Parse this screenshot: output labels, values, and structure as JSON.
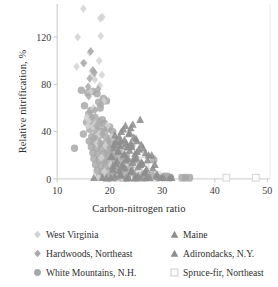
{
  "chart_data": {
    "type": "scatter",
    "title": "",
    "xlabel": "Carbon-nitrogen ratio",
    "ylabel": "Relative nitrification, %",
    "xlim": [
      7.5,
      50.5
    ],
    "ylim": [
      -6,
      148
    ],
    "xticks": [
      10,
      20,
      30,
      40,
      50
    ],
    "yticks": [
      0,
      40,
      80,
      120
    ],
    "grid": false,
    "legend_position": "below",
    "series": [
      {
        "name": "West Virginia",
        "marker": "diamond",
        "color": "#d2d2d2",
        "points": [
          [
            15.0,
            144
          ],
          [
            18.2,
            136
          ],
          [
            18.6,
            137
          ],
          [
            13.9,
            120
          ],
          [
            18.3,
            121
          ],
          [
            16.2,
            107
          ],
          [
            15.2,
            98
          ],
          [
            13.7,
            95
          ],
          [
            18.0,
            100
          ],
          [
            17.0,
            90
          ],
          [
            16.6,
            91
          ],
          [
            16.9,
            88
          ],
          [
            18.5,
            88
          ],
          [
            17.2,
            84
          ],
          [
            18.1,
            79
          ],
          [
            16.3,
            74
          ],
          [
            18.9,
            66
          ],
          [
            16.9,
            60
          ],
          [
            15.6,
            52
          ],
          [
            16.1,
            50
          ],
          [
            17.4,
            47
          ],
          [
            15.8,
            45
          ],
          [
            16.8,
            44
          ],
          [
            19.6,
            45
          ],
          [
            18.0,
            38
          ],
          [
            20.4,
            35
          ],
          [
            17.6,
            30
          ],
          [
            19.2,
            28
          ],
          [
            21.0,
            25
          ],
          [
            18.4,
            18
          ],
          [
            20.2,
            12
          ],
          [
            19.0,
            6
          ],
          [
            21.6,
            3
          ],
          [
            17.8,
            1
          ],
          [
            22.4,
            1
          ]
        ]
      },
      {
        "name": "Hardwoods, Northeast",
        "marker": "diamond",
        "color": "#a9a9a9",
        "points": [
          [
            16.4,
            108
          ],
          [
            15.0,
            98
          ],
          [
            16.8,
            92
          ],
          [
            17.1,
            90
          ],
          [
            16.2,
            85
          ],
          [
            15.9,
            78
          ],
          [
            17.8,
            76
          ],
          [
            16.0,
            70
          ],
          [
            18.4,
            63
          ],
          [
            17.2,
            58
          ],
          [
            16.6,
            52
          ],
          [
            18.0,
            49
          ],
          [
            17.5,
            45
          ],
          [
            19.0,
            42
          ],
          [
            18.6,
            38
          ],
          [
            17.0,
            35
          ],
          [
            19.8,
            33
          ],
          [
            18.2,
            30
          ],
          [
            20.0,
            27
          ],
          [
            19.4,
            22
          ],
          [
            20.8,
            18
          ],
          [
            19.2,
            14
          ],
          [
            21.2,
            10
          ],
          [
            20.6,
            6
          ],
          [
            22.0,
            3
          ],
          [
            21.0,
            1
          ],
          [
            23.0,
            0.5
          ]
        ]
      },
      {
        "name": "White Mountains, N.H.",
        "marker": "circle",
        "color": "#a6a6a6",
        "points": [
          [
            14.6,
            75
          ],
          [
            15.8,
            73
          ],
          [
            16.8,
            74
          ],
          [
            17.6,
            72
          ],
          [
            18.8,
            68
          ],
          [
            17.9,
            65
          ],
          [
            15.2,
            62
          ],
          [
            16.4,
            58
          ],
          [
            18.2,
            60
          ],
          [
            19.4,
            66
          ],
          [
            16.0,
            55
          ],
          [
            17.2,
            52
          ],
          [
            18.6,
            50
          ],
          [
            15.6,
            48
          ],
          [
            16.9,
            46
          ],
          [
            18.0,
            45
          ],
          [
            19.0,
            47
          ],
          [
            20.0,
            44
          ],
          [
            16.2,
            42
          ],
          [
            17.4,
            41
          ],
          [
            18.4,
            40
          ],
          [
            19.6,
            42
          ],
          [
            20.6,
            40
          ],
          [
            13.3,
            26
          ],
          [
            15.0,
            38
          ],
          [
            16.6,
            36
          ],
          [
            17.8,
            35
          ],
          [
            19.2,
            36
          ],
          [
            20.2,
            34
          ],
          [
            21.0,
            33
          ],
          [
            16.1,
            32
          ],
          [
            17.1,
            31
          ],
          [
            18.1,
            30
          ],
          [
            19.1,
            30
          ],
          [
            20.1,
            29
          ],
          [
            21.4,
            29
          ],
          [
            22.2,
            30
          ],
          [
            16.5,
            27
          ],
          [
            17.5,
            26
          ],
          [
            18.5,
            26
          ],
          [
            19.5,
            25
          ],
          [
            20.5,
            25
          ],
          [
            21.8,
            24
          ],
          [
            23.0,
            27
          ],
          [
            24.2,
            28
          ],
          [
            16.8,
            22
          ],
          [
            17.8,
            21
          ],
          [
            18.8,
            21
          ],
          [
            19.8,
            20
          ],
          [
            20.8,
            20
          ],
          [
            22.0,
            19
          ],
          [
            23.2,
            20
          ],
          [
            17.0,
            17
          ],
          [
            18.0,
            16
          ],
          [
            19.0,
            16
          ],
          [
            20.0,
            15
          ],
          [
            21.0,
            15
          ],
          [
            22.4,
            14
          ],
          [
            23.6,
            15
          ],
          [
            25.0,
            16
          ],
          [
            17.3,
            12
          ],
          [
            18.3,
            11
          ],
          [
            19.3,
            11
          ],
          [
            20.3,
            10
          ],
          [
            21.3,
            10
          ],
          [
            22.6,
            9
          ],
          [
            24.0,
            10
          ],
          [
            26.0,
            12
          ],
          [
            28.4,
            16
          ],
          [
            17.6,
            7
          ],
          [
            18.6,
            6
          ],
          [
            19.6,
            6
          ],
          [
            20.6,
            5
          ],
          [
            21.6,
            5
          ],
          [
            23.0,
            4
          ],
          [
            24.4,
            5
          ],
          [
            26.4,
            4
          ],
          [
            28.0,
            3
          ],
          [
            18.0,
            2
          ],
          [
            19.0,
            2
          ],
          [
            20.0,
            1
          ],
          [
            21.0,
            1
          ],
          [
            22.2,
            1
          ],
          [
            23.4,
            1
          ],
          [
            25.0,
            1
          ],
          [
            27.0,
            1
          ],
          [
            29.2,
            1
          ],
          [
            30.4,
            2
          ],
          [
            31.6,
            1
          ],
          [
            34.4,
            1
          ],
          [
            35.2,
            1
          ],
          [
            31.0,
            2
          ],
          [
            33.8,
            1
          ]
        ]
      },
      {
        "name": "Maine",
        "marker": "triangle",
        "color": "#8d8d8d",
        "points": [
          [
            25.8,
            50
          ],
          [
            23.0,
            45
          ],
          [
            24.0,
            43
          ],
          [
            22.2,
            40
          ],
          [
            23.6,
            38
          ],
          [
            21.8,
            36
          ],
          [
            24.6,
            35
          ],
          [
            22.8,
            33
          ],
          [
            25.2,
            32
          ],
          [
            21.2,
            31
          ],
          [
            23.2,
            30
          ],
          [
            26.0,
            29
          ],
          [
            22.0,
            28
          ],
          [
            24.2,
            27
          ],
          [
            20.8,
            26
          ],
          [
            25.6,
            25
          ],
          [
            23.8,
            24
          ],
          [
            21.6,
            23
          ],
          [
            26.8,
            22
          ],
          [
            24.8,
            21
          ],
          [
            22.6,
            20
          ],
          [
            28.0,
            20
          ],
          [
            20.4,
            19
          ],
          [
            25.0,
            18
          ],
          [
            23.4,
            17
          ],
          [
            27.2,
            16
          ],
          [
            21.4,
            15
          ],
          [
            24.4,
            14
          ],
          [
            26.2,
            13
          ],
          [
            22.4,
            12
          ],
          [
            28.6,
            12
          ],
          [
            20.6,
            11
          ],
          [
            25.4,
            10
          ],
          [
            23.0,
            9
          ],
          [
            27.0,
            8
          ],
          [
            21.8,
            7
          ],
          [
            24.0,
            6
          ],
          [
            26.6,
            5
          ],
          [
            29.0,
            4
          ],
          [
            22.2,
            3
          ],
          [
            25.0,
            2
          ],
          [
            27.6,
            1
          ],
          [
            20.2,
            1
          ],
          [
            23.2,
            0.5
          ],
          [
            29.8,
            1
          ],
          [
            31.4,
            1
          ],
          [
            26.0,
            0.5
          ],
          [
            18.6,
            1
          ],
          [
            17.0,
            1
          ]
        ]
      },
      {
        "name": "Adirondacks, N.Y.",
        "marker": "triangle",
        "color": "#8d8d8d",
        "points": [
          [
            24.4,
            46
          ],
          [
            22.6,
            42
          ],
          [
            23.8,
            39
          ],
          [
            21.0,
            37
          ],
          [
            25.0,
            34
          ],
          [
            22.0,
            32
          ],
          [
            24.0,
            30
          ],
          [
            20.8,
            29
          ],
          [
            23.4,
            27
          ],
          [
            26.4,
            26
          ],
          [
            21.6,
            24
          ],
          [
            25.2,
            23
          ],
          [
            22.8,
            21
          ],
          [
            27.4,
            20
          ],
          [
            20.2,
            19
          ],
          [
            24.6,
            17
          ],
          [
            23.0,
            16
          ],
          [
            26.0,
            14
          ],
          [
            21.2,
            13
          ],
          [
            25.8,
            12
          ],
          [
            22.4,
            10
          ],
          [
            28.2,
            9
          ],
          [
            20.6,
            8
          ],
          [
            24.2,
            7
          ],
          [
            26.8,
            6
          ],
          [
            22.0,
            4
          ],
          [
            25.4,
            3
          ],
          [
            28.8,
            2
          ],
          [
            21.0,
            2
          ],
          [
            23.6,
            1
          ],
          [
            27.0,
            1
          ],
          [
            30.2,
            1
          ],
          [
            24.8,
            0.5
          ],
          [
            19.4,
            0.5
          ],
          [
            31.8,
            1
          ]
        ]
      },
      {
        "name": "Spruce-fir, Northeast",
        "marker": "square-open",
        "color": "#d8d8d8",
        "points": [
          [
            26.2,
            21
          ],
          [
            28.0,
            17
          ],
          [
            24.0,
            14
          ],
          [
            25.6,
            12
          ],
          [
            23.0,
            11
          ],
          [
            26.8,
            10
          ],
          [
            22.4,
            8
          ],
          [
            24.6,
            7
          ],
          [
            27.6,
            6
          ],
          [
            23.8,
            5
          ],
          [
            25.0,
            4
          ],
          [
            29.0,
            3
          ],
          [
            22.8,
            3
          ],
          [
            26.0,
            2
          ],
          [
            30.2,
            2
          ],
          [
            24.2,
            1
          ],
          [
            27.2,
            1
          ],
          [
            31.0,
            1
          ],
          [
            21.8,
            1
          ],
          [
            28.6,
            1
          ],
          [
            33.8,
            1
          ],
          [
            35.0,
            1
          ],
          [
            42.2,
            1
          ],
          [
            47.8,
            1
          ],
          [
            30.8,
            2
          ],
          [
            20.4,
            1
          ],
          [
            19.6,
            1
          ]
        ]
      }
    ]
  },
  "axes": {
    "y_title": "Relative nitrification, %",
    "x_title": "Carbon-nitrogen ratio",
    "x_tick_labels": [
      "10",
      "20",
      "30",
      "40",
      "50"
    ],
    "y_tick_labels": [
      "0",
      "40",
      "80",
      "120"
    ]
  },
  "legend": {
    "entries": [
      {
        "label": "West Virginia",
        "marker": "diamond",
        "color": "#d2d2d2"
      },
      {
        "label": "Maine",
        "marker": "triangle",
        "color": "#8d8d8d"
      },
      {
        "label": "Hardwoods, Northeast",
        "marker": "diamond",
        "color": "#a9a9a9"
      },
      {
        "label": "Adirondacks, N.Y.",
        "marker": "triangle",
        "color": "#8d8d8d"
      },
      {
        "label": "White Mountains, N.H.",
        "marker": "circle",
        "color": "#a6a6a6"
      },
      {
        "label": "Spruce-fir, Northeast",
        "marker": "square-open",
        "color": "#cfcfcf"
      }
    ]
  },
  "colors": {
    "axis_line": "#c9c9c9",
    "tick_label": "#3a3a3a",
    "background": "#ffffff"
  }
}
